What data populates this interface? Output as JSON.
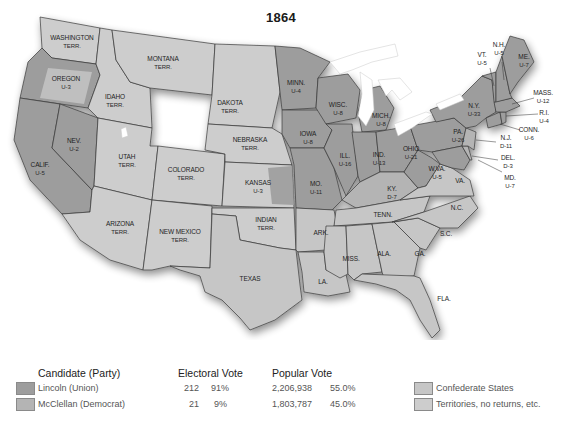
{
  "title": "1864",
  "colors": {
    "lincoln_union": "#9d9d9d",
    "mcclellan_democrat": "#b4b4b4",
    "confederate": "#c6c6c6",
    "territories": "#cdcdcd"
  },
  "states": {
    "washington": {
      "name": "WASHINGTON",
      "line2": "TERR."
    },
    "oregon": {
      "name": "OREGON",
      "line2": "U-3"
    },
    "california": {
      "name": "CALIF.",
      "line2": "U-5"
    },
    "nevada": {
      "name": "NEV.",
      "line2": "U-2"
    },
    "idaho": {
      "name": "IDAHO",
      "line2": "TERR."
    },
    "montana": {
      "name": "MONTANA",
      "line2": "TERR."
    },
    "utah": {
      "name": "UTAH",
      "line2": "TERR."
    },
    "arizona": {
      "name": "ARIZONA",
      "line2": "TERR."
    },
    "colorado": {
      "name": "COLORADO",
      "line2": "TERR."
    },
    "new_mexico": {
      "name": "NEW MEXICO",
      "line2": "TERR."
    },
    "dakota": {
      "name": "DAKOTA",
      "line2": "TERR."
    },
    "nebraska": {
      "name": "NEBRASKA",
      "line2": "TERR."
    },
    "kansas": {
      "name": "KANSAS",
      "line2": "U-3"
    },
    "indian": {
      "name": "INDIAN",
      "line2": "TERR."
    },
    "texas": {
      "name": "TEXAS"
    },
    "minnesota": {
      "name": "MINN.",
      "line2": "U-4"
    },
    "iowa": {
      "name": "IOWA",
      "line2": "U-8"
    },
    "missouri": {
      "name": "MO.",
      "line2": "U-11"
    },
    "arkansas": {
      "name": "ARK."
    },
    "louisiana": {
      "name": "LA."
    },
    "wisconsin": {
      "name": "WISC.",
      "line2": "U-8"
    },
    "illinois": {
      "name": "ILL.",
      "line2": "U-16"
    },
    "michigan": {
      "name": "MICH.",
      "line2": "U-8"
    },
    "indiana": {
      "name": "IND.",
      "line2": "U-13"
    },
    "ohio": {
      "name": "OHIO",
      "line2": "U-21"
    },
    "kentucky": {
      "name": "KY.",
      "line2": "D-7"
    },
    "tennessee": {
      "name": "TENN."
    },
    "mississippi": {
      "name": "MISS."
    },
    "alabama": {
      "name": "ALA."
    },
    "georgia": {
      "name": "GA."
    },
    "florida": {
      "name": "FLA."
    },
    "south_carolina": {
      "name": "S.C."
    },
    "north_carolina": {
      "name": "N.C."
    },
    "virginia": {
      "name": "VA."
    },
    "west_virginia": {
      "name": "W.VA.",
      "line2": "U-5"
    },
    "pennsylvania": {
      "name": "PA.",
      "line2": "U-26"
    },
    "new_york": {
      "name": "N.Y.",
      "line2": "U-33"
    },
    "vermont": {
      "name": "VT.",
      "line2": "U-5"
    },
    "new_hampshire": {
      "name": "N.H.",
      "line2": "U-5"
    },
    "maine": {
      "name": "ME.",
      "line2": "U-7"
    },
    "massachusetts": {
      "name": "MASS.",
      "line2": "U-12"
    },
    "rhode_island": {
      "name": "R.I.",
      "line2": "U-4"
    },
    "connecticut": {
      "name": "CONN.",
      "line2": "U-6"
    },
    "new_jersey": {
      "name": "N.J.",
      "line2": "D-11"
    },
    "delaware": {
      "name": "DEL.",
      "line2": "D-3"
    },
    "maryland": {
      "name": "MD.",
      "line2": "U-7"
    }
  },
  "legend": {
    "candidate_header": "Candidate (Party)",
    "electoral_header": "Electoral Vote",
    "popular_header": "Popular Vote",
    "rows": [
      {
        "candidate": "Lincoln (Union)",
        "ev": "212",
        "ev_pct": "91%",
        "pv": "2,206,938",
        "pv_pct": "55.0%"
      },
      {
        "candidate": "McClellan (Democrat)",
        "ev": "21",
        "ev_pct": "9%",
        "pv": "1,803,787",
        "pv_pct": "45.0%"
      }
    ],
    "other": [
      {
        "label": "Confederate States"
      },
      {
        "label": "Territories, no returns, etc."
      }
    ]
  }
}
